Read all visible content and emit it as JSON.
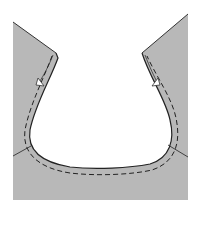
{
  "diagram": {
    "colors": {
      "fabric": "#b8b8b8",
      "outline": "#333333",
      "stitch": "#222222",
      "background": "#ffffff"
    },
    "elements": [
      {
        "name": "fabric-piece",
        "description": "Gray garment front with scooped neckline"
      },
      {
        "name": "seam-fold",
        "description": "Folded seam allowance along neckline"
      },
      {
        "name": "stitch-line",
        "description": "Dashed stitching line following neckline curve"
      },
      {
        "name": "notch-left",
        "description": "Triangular notch on left shoulder edge"
      },
      {
        "name": "notch-right",
        "description": "Triangular notch on right shoulder edge"
      },
      {
        "name": "side-seam-left",
        "description": "Short seam line at left side"
      },
      {
        "name": "side-seam-right",
        "description": "Short seam line at right side"
      }
    ]
  }
}
